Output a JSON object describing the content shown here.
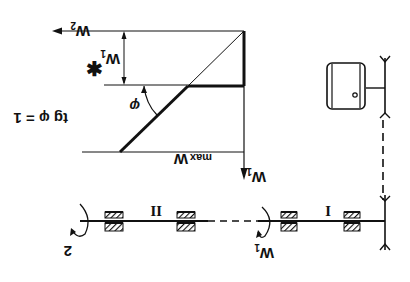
{
  "orientation": "rotated-180",
  "graph": {
    "labels": {
      "w2_axis": "W₂",
      "w1_axis": "W₁",
      "w1_star": "W₁*",
      "w_max": "W max",
      "w_max_main": "W",
      "w_max_sub": "max",
      "angle": "φ",
      "tg_formula": "tg φ = 1",
      "w1_star_main": "W",
      "w1_star_sub": "1",
      "w1_axis_main": "W",
      "w1_axis_sub": "1",
      "w2_main": "W",
      "w2_sub": "2"
    }
  },
  "mechanism": {
    "shaft_labels": {
      "shaft_1": "I",
      "shaft_2": "II"
    },
    "rotation_labels": {
      "shaft_1": "W₁",
      "shaft_1_main": "W",
      "shaft_1_sub": "1",
      "shaft_2": "2"
    },
    "components": [
      "motor",
      "belt/chain drive",
      "bearing",
      "bearing",
      "bearing",
      "bearing"
    ]
  },
  "colors": {
    "ink": "#111111",
    "background": "#ffffff"
  }
}
